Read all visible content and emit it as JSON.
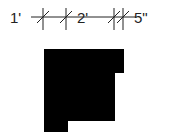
{
  "diagram": {
    "dimension_labels": [
      {
        "text": "1'",
        "x": 10,
        "y": 10
      },
      {
        "text": "2'",
        "x": 77,
        "y": 10
      },
      {
        "text": "5\"",
        "x": 134,
        "y": 10
      }
    ],
    "colors": {
      "shape_fill": "#000000",
      "line": "#222222",
      "background": "#ffffff"
    },
    "dimension_line_y": 17,
    "ticks_x": [
      43,
      66,
      114,
      123
    ],
    "shape_points": "44,49 124,49 124,73 115,73 115,121 68,121 68,132 44,132"
  }
}
